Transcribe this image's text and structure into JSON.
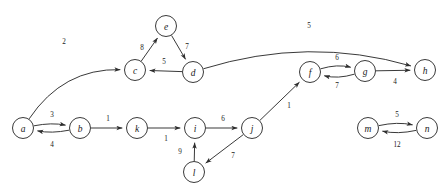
{
  "figure": {
    "background_color": "#ffffff",
    "node_fill": "#ffffff",
    "node_stroke": "#3a3a3a",
    "edge_color": "#2e2e2e",
    "label_color": "#1a1a1a"
  },
  "chart_data": {
    "type": "diagram",
    "diagram_type": "weighted-directed-graph",
    "directed": true,
    "weighted": true,
    "node_count": 14,
    "edge_count": 18,
    "nodes": [
      {
        "id": "a",
        "label": "a",
        "x": 23,
        "y": 128,
        "r": 10.5
      },
      {
        "id": "b",
        "label": "b",
        "x": 80,
        "y": 128,
        "r": 10.5
      },
      {
        "id": "c",
        "label": "c",
        "x": 135,
        "y": 70,
        "r": 10.5
      },
      {
        "id": "d",
        "label": "d",
        "x": 193,
        "y": 72,
        "r": 10.5
      },
      {
        "id": "e",
        "label": "e",
        "x": 166,
        "y": 26,
        "r": 10.5
      },
      {
        "id": "f",
        "label": "f",
        "x": 310,
        "y": 72,
        "r": 10.5
      },
      {
        "id": "g",
        "label": "g",
        "x": 365,
        "y": 71,
        "r": 10.5
      },
      {
        "id": "h",
        "label": "h",
        "x": 425,
        "y": 70,
        "r": 10.5
      },
      {
        "id": "i",
        "label": "i",
        "x": 195,
        "y": 128,
        "r": 10.5
      },
      {
        "id": "j",
        "label": "j",
        "x": 252,
        "y": 128,
        "r": 10.5
      },
      {
        "id": "k",
        "label": "k",
        "x": 137,
        "y": 128,
        "r": 10.5
      },
      {
        "id": "l",
        "label": "l",
        "x": 194,
        "y": 172,
        "r": 10.5
      },
      {
        "id": "m",
        "label": "m",
        "x": 368,
        "y": 128,
        "r": 10.5
      },
      {
        "id": "n",
        "label": "n",
        "x": 427,
        "y": 128,
        "r": 10.5
      }
    ],
    "edges": [
      {
        "from": "a",
        "to": "c",
        "weight": 2,
        "shape": "curve",
        "curvature": -0.55,
        "label_x": 64,
        "label_y": 42
      },
      {
        "from": "a",
        "to": "b",
        "weight": 3,
        "shape": "curve",
        "curvature": -0.2,
        "label_x": 52,
        "label_y": 115
      },
      {
        "from": "b",
        "to": "a",
        "weight": 4,
        "shape": "curve",
        "curvature": -0.2,
        "label_x": 52,
        "label_y": 145
      },
      {
        "from": "b",
        "to": "k",
        "weight": 1,
        "shape": "line",
        "curvature": 0,
        "label_x": 108,
        "label_y": 119
      },
      {
        "from": "k",
        "to": "i",
        "weight": 1,
        "shape": "line",
        "curvature": 0,
        "label_x": 166,
        "label_y": 139
      },
      {
        "from": "i",
        "to": "j",
        "weight": 6,
        "shape": "line",
        "curvature": 0,
        "label_x": 223,
        "label_y": 119
      },
      {
        "from": "j",
        "to": "l",
        "weight": 7,
        "shape": "line",
        "curvature": 0,
        "label_x": 233,
        "label_y": 156
      },
      {
        "from": "l",
        "to": "i",
        "weight": 9,
        "shape": "line",
        "curvature": 0,
        "label_x": 180,
        "label_y": 152
      },
      {
        "from": "j",
        "to": "f",
        "weight": 1,
        "shape": "line",
        "curvature": 0,
        "label_x": 289,
        "label_y": 106
      },
      {
        "from": "c",
        "to": "e",
        "weight": 8,
        "shape": "line",
        "curvature": 0,
        "label_x": 142,
        "label_y": 48
      },
      {
        "from": "e",
        "to": "d",
        "weight": 7,
        "shape": "line",
        "curvature": 0,
        "label_x": 187,
        "label_y": 47
      },
      {
        "from": "d",
        "to": "c",
        "weight": 5,
        "shape": "line",
        "curvature": 0,
        "label_x": 164,
        "label_y": 62
      },
      {
        "from": "d",
        "to": "h",
        "weight": 5,
        "shape": "curve",
        "curvature": -0.3,
        "label_x": 309,
        "label_y": 26
      },
      {
        "from": "f",
        "to": "g",
        "weight": 6,
        "shape": "curve",
        "curvature": -0.28,
        "label_x": 337,
        "label_y": 58
      },
      {
        "from": "g",
        "to": "f",
        "weight": 7,
        "shape": "curve",
        "curvature": -0.28,
        "label_x": 337,
        "label_y": 86
      },
      {
        "from": "g",
        "to": "h",
        "weight": 4,
        "shape": "line",
        "curvature": 0,
        "label_x": 395,
        "label_y": 82
      },
      {
        "from": "m",
        "to": "n",
        "weight": 5,
        "shape": "curve",
        "curvature": -0.22,
        "label_x": 397,
        "label_y": 115
      },
      {
        "from": "n",
        "to": "m",
        "weight": 12,
        "shape": "curve",
        "curvature": -0.22,
        "label_x": 397,
        "label_y": 145
      }
    ],
    "components": [
      {
        "name": "main-component",
        "nodes": [
          "a",
          "b",
          "c",
          "d",
          "e",
          "f",
          "g",
          "h",
          "i",
          "j",
          "k",
          "l"
        ]
      },
      {
        "name": "isolated-pair",
        "nodes": [
          "m",
          "n"
        ]
      }
    ]
  }
}
